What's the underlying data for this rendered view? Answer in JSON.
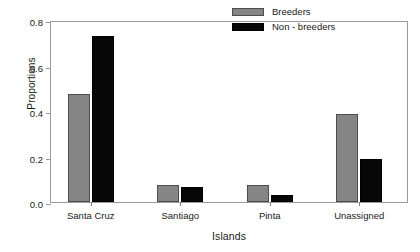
{
  "chart_data": {
    "type": "bar",
    "title": "",
    "xlabel": "Islands",
    "ylabel": "Proportions",
    "categories": [
      "Santa Cruz",
      "Santiago",
      "Pinta",
      "Unassigned"
    ],
    "series": [
      {
        "name": "Breeders",
        "color": "#858585",
        "values": [
          0.475,
          0.075,
          0.075,
          0.385
        ]
      },
      {
        "name": "Non - breeders",
        "color": "#070707",
        "values": [
          0.73,
          0.065,
          0.03,
          0.19
        ]
      }
    ],
    "ylim": [
      0.0,
      0.8
    ],
    "yticks": [
      0.0,
      0.2,
      0.4,
      0.6,
      0.8
    ],
    "ytick_labels": [
      "0.0",
      "0.2",
      "0.4",
      "0.6",
      "0.8"
    ],
    "grid": false,
    "legend_position": "top-right",
    "legend_entries": [
      "Breeders",
      "Non - breeders"
    ]
  }
}
